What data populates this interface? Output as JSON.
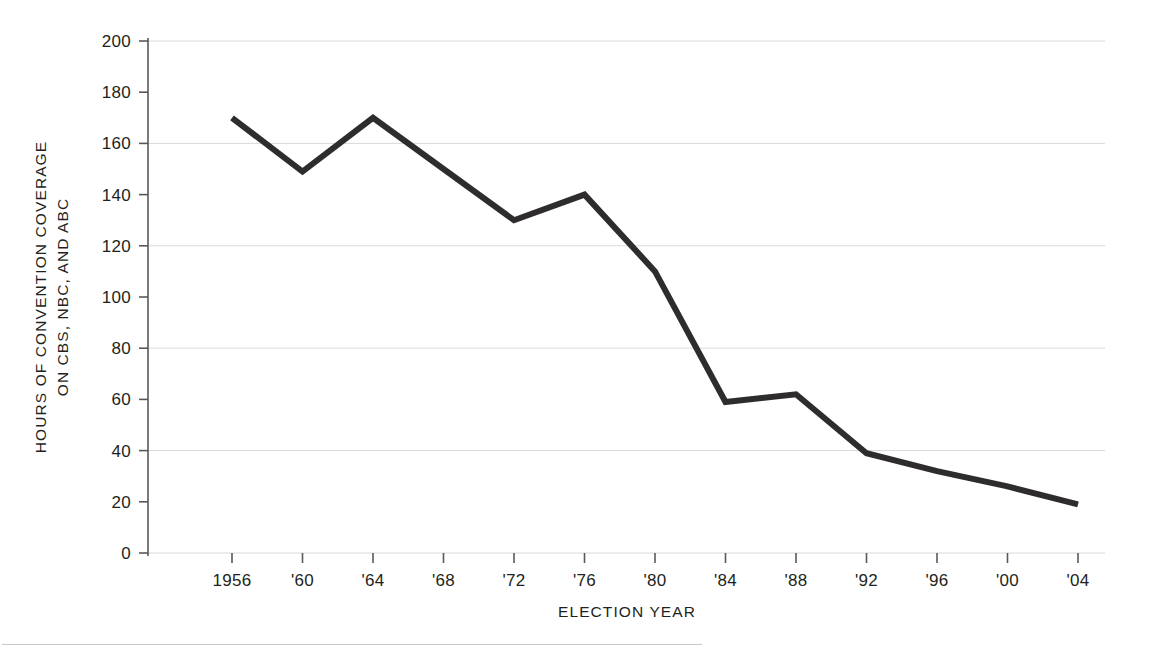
{
  "figure": {
    "top_caption": "",
    "background_color": "#ffffff"
  },
  "chart_data": {
    "type": "line",
    "title": "",
    "xlabel": "ELECTION  YEAR",
    "ylabel_line1": "HOURS OF CONVENTION COVERAGE",
    "ylabel_line2": "ON CBS, NBC, AND ABC",
    "categories": [
      "1956",
      "'60",
      "'64",
      "'68",
      "'72",
      "'76",
      "'80",
      "'84",
      "'88",
      "'92",
      "'96",
      "'00",
      "'04"
    ],
    "x_values": [
      1956,
      1960,
      1964,
      1968,
      1972,
      1976,
      1980,
      1984,
      1988,
      1992,
      1996,
      2000,
      2004
    ],
    "values": [
      170,
      149,
      170,
      150,
      130,
      140,
      110,
      59,
      62,
      39,
      32,
      26,
      19
    ],
    "series": [
      {
        "name": "Hours of convention coverage on CBS, NBC, and ABC",
        "values": [
          170,
          149,
          170,
          150,
          130,
          140,
          110,
          59,
          62,
          39,
          32,
          26,
          19
        ]
      }
    ],
    "ylim": [
      0,
      200
    ],
    "y_ticks": [
      0,
      20,
      40,
      60,
      80,
      100,
      120,
      140,
      160,
      180,
      200
    ],
    "y_tick_labels": [
      "0",
      "20",
      "40",
      "60",
      "80",
      "100",
      "120",
      "140",
      "160",
      "180",
      "200"
    ],
    "gridlines_y": [
      0,
      40,
      80,
      120,
      160,
      200
    ],
    "grid": true,
    "legend": "none",
    "line_color": "#2e2c2d",
    "grid_color": "#d9d9dc",
    "axis_color": "#58585b",
    "line_width": 6
  }
}
